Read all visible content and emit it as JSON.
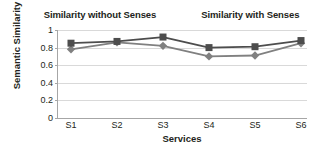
{
  "chart_data": {
    "type": "line",
    "title": "",
    "xlabel": "Services",
    "ylabel": "Semantic Similarity",
    "categories": [
      "S1",
      "S2",
      "S3",
      "S4",
      "S5",
      "S6"
    ],
    "ylim": [
      0,
      1
    ],
    "yticks": [
      0,
      0.2,
      0.4,
      0.6,
      0.8,
      1
    ],
    "ytick_labels": [
      "0",
      "0.2",
      "0.4",
      "0.6",
      "0.8",
      "1"
    ],
    "grid": true,
    "legend_position": "top",
    "series": [
      {
        "name": "Similarity without Senses",
        "marker": "diamond",
        "color": "#808080",
        "values": [
          0.78,
          0.86,
          0.82,
          0.7,
          0.71,
          0.85
        ]
      },
      {
        "name": "Similarity with Senses",
        "marker": "square",
        "color": "#4d4d4d",
        "values": [
          0.85,
          0.87,
          0.92,
          0.8,
          0.81,
          0.88
        ]
      }
    ]
  },
  "colors": {
    "series_without_senses": "#808080",
    "series_with_senses": "#4d4d4d",
    "gridline": "#d9d9d9",
    "axis": "#a6a6a6",
    "text": "#231f20",
    "background": "#ffffff"
  }
}
